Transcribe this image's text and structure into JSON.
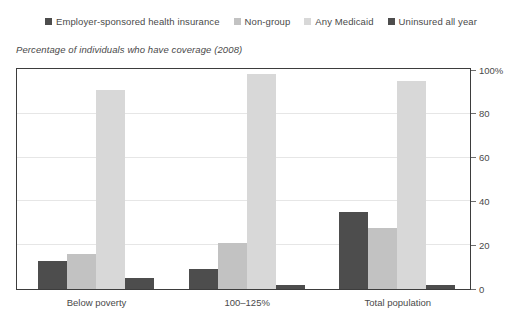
{
  "subtitle": "Percentage of individuals who have coverage (2008)",
  "legend": {
    "items": [
      {
        "label": "Employer-sponsored health insurance",
        "color": "#4d4d4d"
      },
      {
        "label": "Non-group",
        "color": "#c2c2c2"
      },
      {
        "label": "Any Medicaid",
        "color": "#d8d8d8"
      },
      {
        "label": "Uninsured all year",
        "color": "#4d4d4d"
      }
    ]
  },
  "axis": {
    "y_ticks": [
      "0",
      "20",
      "40",
      "60",
      "80",
      "100%"
    ],
    "y_tick_values": [
      0,
      20,
      40,
      60,
      80,
      100
    ]
  },
  "chart_data": {
    "type": "bar",
    "title": "",
    "subtitle": "Percentage of individuals who have coverage (2008)",
    "xlabel": "",
    "ylabel": "",
    "ylim": [
      0,
      100
    ],
    "grid": true,
    "legend_position": "top",
    "categories": [
      "Below poverty",
      "100–125%",
      "Total population"
    ],
    "series": [
      {
        "name": "Employer-sponsored health insurance",
        "color": "#4d4d4d",
        "values": [
          13,
          9,
          35
        ]
      },
      {
        "name": "Non-group",
        "color": "#c2c2c2",
        "values": [
          16,
          21,
          28
        ]
      },
      {
        "name": "Any Medicaid",
        "color": "#d8d8d8",
        "values": [
          91,
          98,
          95
        ]
      },
      {
        "name": "Uninsured all year",
        "color": "#4d4d4d",
        "values": [
          5,
          2,
          2
        ]
      }
    ]
  }
}
